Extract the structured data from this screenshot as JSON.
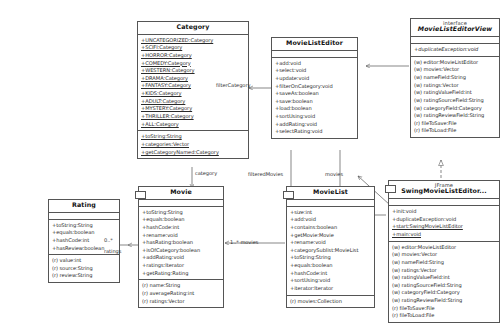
{
  "diagram": {
    "type": "uml-class-diagram",
    "classes": [
      {
        "id": "category",
        "name": "Category",
        "stereotype": "",
        "constants": [
          "+UNCATEGORIZED:Category",
          "+SCIFI:Category",
          "+HORROR:Category",
          "+COMEDY:Category",
          "+WESTERN:Category",
          "+DRAMA:Category",
          "+FANTASY:Category",
          "+KIDS:Category",
          "+ADULT:Category",
          "+MYSTERY:Category",
          "+THRILLER:Category",
          "+ALL:Category"
        ],
        "members": [
          "+toString:String",
          "+categories:Vector",
          "+getCategoryNamed:Category"
        ]
      },
      {
        "id": "movielisteditor",
        "name": "MovieListEditor",
        "stereotype": "",
        "operations": [
          "+add:void",
          "+select:void",
          "+update:void",
          "+filterOnCategory:void",
          "+saveAs:boolean",
          "+save:boolean",
          "+load:boolean",
          "+sortUsing:void",
          "+addRating:void",
          "+selectRating:void"
        ]
      },
      {
        "id": "movielisteditorview",
        "name": "MovieListEditorView",
        "stereotype": "interface",
        "operations": [
          "+duplicateException:void"
        ],
        "attributes": [
          "(w) editor:MovieListEditor",
          "(w) movies:Vector",
          "(w) nameField:String",
          "(w) ratings:Vector",
          "(w) ratingValueField:int",
          "(w) ratingSourceField:String",
          "(w) categoryField:Category",
          "(w) ratingReviewField:String",
          "(r) fileToSave:File",
          "(r) fileToLoad:File"
        ]
      },
      {
        "id": "rating",
        "name": "Rating",
        "stereotype": "",
        "operations": [
          "+toString:String",
          "+equals:boolean",
          "+hashCode:int",
          "+hasReview:boolean"
        ],
        "attributes": [
          "(r) value:int",
          "(r) source:String",
          "(r) review:String"
        ]
      },
      {
        "id": "movie",
        "name": "Movie",
        "stereotype": "",
        "operations": [
          "+toString:String",
          "+equals:boolean",
          "+hashCode:int",
          "+rename:void",
          "+hasRating:boolean",
          "+isOfCategory:boolean",
          "+addRating:void",
          "+ratings:Iterator",
          "+getRating:Rating"
        ],
        "attributes": [
          "(r) name:String",
          "(r) averageRating:int",
          "(r) ratings:Vector"
        ]
      },
      {
        "id": "movielist",
        "name": "MovieList",
        "stereotype": "",
        "operations": [
          "+size:int",
          "+add:void",
          "+contains:boolean",
          "+getMovie:Movie",
          "+rename:void",
          "+categorySublist:MovieList",
          "+toString:String",
          "+equals:boolean",
          "+hashCode:int",
          "+sortUsing:void",
          "+iterator:Iterator"
        ],
        "attributes": [
          "(r) movies:Collection"
        ]
      },
      {
        "id": "swingmovielisteditor",
        "name": "SwingMovieListEditor...",
        "stereotype": "JFrame",
        "operations": [
          "+init:void",
          "+duplicateException:void",
          "+start:SwingMovieListEditor",
          "+main:void"
        ],
        "attributes": [
          "(w) editor:MovieListEditor",
          "(w) movies:Vector",
          "(w) nameField:String",
          "(w) ratings:Vector",
          "(w) ratingValueField:int",
          "(w) ratingSourceField:String",
          "(w) categoryField:Category",
          "(w) ratingReviewField:String",
          "(r) fileToSave:File",
          "(r) fileToLoad:File"
        ]
      }
    ],
    "edge_labels": [
      {
        "id": "filtercategory",
        "text": "filterCategory"
      },
      {
        "id": "category",
        "text": "category"
      },
      {
        "id": "filteredmovies",
        "text": "filteredMovies"
      },
      {
        "id": "movies",
        "text": "movies"
      },
      {
        "id": "ratings",
        "text": "ratings"
      },
      {
        "id": "ratings-mult",
        "text": "0..*"
      },
      {
        "id": "movies-mult",
        "text": "1..*   movies"
      }
    ],
    "colors": {
      "line": "#555555",
      "text": "#2a2a2a",
      "background": "#ffffff"
    }
  }
}
